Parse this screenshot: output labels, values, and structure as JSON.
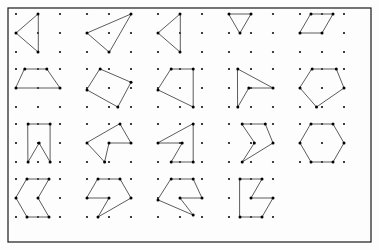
{
  "figure": {
    "canvas": {
      "width": 379,
      "height": 250
    },
    "frame": {
      "x": 8,
      "y": 8,
      "width": 363,
      "height": 234,
      "stroke": "#1a1a1a"
    },
    "style": {
      "dot_color": "#111111",
      "vertex_color": "#000000",
      "edge_color": "#4a4a4a",
      "background": "#fdfdfd",
      "dot_radius": 1.1,
      "vertex_radius": 1.5,
      "edge_width": 0.9
    },
    "grid": {
      "rows": 4,
      "cols": 5,
      "cell_width": 71,
      "cell_height": 55,
      "origin_x": 16,
      "origin_y": 14
    },
    "lattice": {
      "cols": 3,
      "rows": 3,
      "spacing_x": 22,
      "spacing_y": 19,
      "description": "each cell holds a 3x3 square lattice of dots"
    },
    "cells": [
      {
        "id": "cell-r1c1",
        "row": 1,
        "col": 1,
        "shape": "triangle",
        "dots": [
          [
            0,
            0
          ],
          [
            1,
            0
          ],
          [
            2,
            0
          ],
          [
            0,
            1
          ],
          [
            1,
            1
          ],
          [
            2,
            1
          ],
          [
            0,
            2
          ],
          [
            1,
            2
          ],
          [
            2,
            2
          ]
        ],
        "polygon": [
          [
            1,
            0
          ],
          [
            0,
            1
          ],
          [
            1,
            2
          ]
        ]
      },
      {
        "id": "cell-r1c2",
        "row": 1,
        "col": 2,
        "shape": "triangle",
        "dots": [
          [
            0,
            0
          ],
          [
            1,
            0
          ],
          [
            2,
            0
          ],
          [
            0,
            1
          ],
          [
            1,
            1
          ],
          [
            2,
            1
          ],
          [
            0,
            2
          ],
          [
            1,
            2
          ],
          [
            2,
            2
          ]
        ],
        "polygon": [
          [
            2,
            0
          ],
          [
            0,
            1
          ],
          [
            1,
            2
          ]
        ]
      },
      {
        "id": "cell-r1c3",
        "row": 1,
        "col": 3,
        "shape": "triangle",
        "dots": [
          [
            0,
            0
          ],
          [
            1,
            0
          ],
          [
            2,
            0
          ],
          [
            0,
            1
          ],
          [
            1,
            1
          ],
          [
            2,
            1
          ],
          [
            0,
            2
          ],
          [
            1,
            2
          ],
          [
            2,
            2
          ]
        ],
        "polygon": [
          [
            1,
            0
          ],
          [
            0,
            1
          ],
          [
            1,
            2
          ]
        ]
      },
      {
        "id": "cell-r1c4",
        "row": 1,
        "col": 4,
        "shape": "triangle",
        "dots": [
          [
            0,
            0
          ],
          [
            1,
            0
          ],
          [
            2,
            0
          ],
          [
            0,
            1
          ],
          [
            1,
            1
          ],
          [
            2,
            1
          ],
          [
            0,
            2
          ],
          [
            1,
            2
          ],
          [
            2,
            2
          ]
        ],
        "polygon": [
          [
            0,
            0
          ],
          [
            1,
            0
          ],
          [
            0.5,
            1
          ]
        ]
      },
      {
        "id": "cell-r1c5",
        "row": 1,
        "col": 5,
        "shape": "parallelogram",
        "dots": [
          [
            0,
            0
          ],
          [
            1,
            0
          ],
          [
            2,
            0
          ],
          [
            0,
            1
          ],
          [
            1,
            1
          ],
          [
            2,
            1
          ],
          [
            0,
            2
          ],
          [
            1,
            2
          ],
          [
            2,
            2
          ]
        ],
        "polygon": [
          [
            0.5,
            0
          ],
          [
            1.5,
            0
          ],
          [
            1,
            1
          ],
          [
            0,
            1
          ]
        ]
      },
      {
        "id": "cell-r2c1",
        "row": 2,
        "col": 1,
        "shape": "trapezoid",
        "dots": [
          [
            0,
            0
          ],
          [
            1,
            0
          ],
          [
            2,
            0
          ],
          [
            0,
            1
          ],
          [
            1,
            1
          ],
          [
            2,
            1
          ],
          [
            0,
            2
          ],
          [
            1,
            2
          ],
          [
            2,
            2
          ]
        ],
        "polygon": [
          [
            0.4,
            0
          ],
          [
            1.4,
            0
          ],
          [
            2,
            1
          ],
          [
            0,
            1
          ]
        ]
      },
      {
        "id": "cell-r2c2",
        "row": 2,
        "col": 2,
        "shape": "rotated-rectangle",
        "dots": [
          [
            0,
            0
          ],
          [
            1,
            0
          ],
          [
            2,
            0
          ],
          [
            0,
            1
          ],
          [
            1,
            1
          ],
          [
            2,
            1
          ],
          [
            0,
            2
          ],
          [
            1,
            2
          ],
          [
            2,
            2
          ]
        ],
        "polygon": [
          [
            0.6,
            0
          ],
          [
            2,
            0.7
          ],
          [
            1.4,
            2
          ],
          [
            0,
            1.1
          ]
        ]
      },
      {
        "id": "cell-r2c3",
        "row": 2,
        "col": 3,
        "shape": "quadrilateral",
        "dots": [
          [
            0,
            0
          ],
          [
            1,
            0
          ],
          [
            2,
            0
          ],
          [
            0,
            1
          ],
          [
            1,
            1
          ],
          [
            2,
            1
          ],
          [
            0,
            2
          ],
          [
            1,
            2
          ],
          [
            2,
            2
          ]
        ],
        "polygon": [
          [
            0.6,
            0
          ],
          [
            1.6,
            0
          ],
          [
            1.6,
            2
          ],
          [
            0,
            1.1
          ]
        ]
      },
      {
        "id": "cell-r2c4",
        "row": 2,
        "col": 4,
        "shape": "concave-arrow",
        "dots": [
          [
            0,
            0
          ],
          [
            1,
            0
          ],
          [
            2,
            0
          ],
          [
            0,
            1
          ],
          [
            1,
            1
          ],
          [
            2,
            1
          ],
          [
            0,
            2
          ],
          [
            1,
            2
          ],
          [
            2,
            2
          ]
        ],
        "polygon": [
          [
            0.4,
            0
          ],
          [
            2,
            1
          ],
          [
            0.9,
            1
          ],
          [
            0.4,
            2
          ]
        ]
      },
      {
        "id": "cell-r2c5",
        "row": 2,
        "col": 5,
        "shape": "pentagon",
        "dots": [
          [
            0,
            0
          ],
          [
            1,
            0
          ],
          [
            2,
            0
          ],
          [
            0,
            1
          ],
          [
            1,
            1
          ],
          [
            2,
            1
          ],
          [
            0,
            2
          ],
          [
            1,
            2
          ],
          [
            2,
            2
          ]
        ],
        "polygon": [
          [
            0.55,
            0
          ],
          [
            1.65,
            0
          ],
          [
            2,
            1
          ],
          [
            0.75,
            2
          ],
          [
            0,
            1
          ]
        ]
      },
      {
        "id": "cell-r3c1",
        "row": 3,
        "col": 1,
        "shape": "concave-banner",
        "dots": [
          [
            0,
            0
          ],
          [
            1,
            0
          ],
          [
            2,
            0
          ],
          [
            0,
            1
          ],
          [
            1,
            1
          ],
          [
            2,
            1
          ],
          [
            0,
            2
          ],
          [
            1,
            2
          ],
          [
            2,
            2
          ]
        ],
        "polygon": [
          [
            0.55,
            0
          ],
          [
            1.55,
            0
          ],
          [
            1.55,
            2
          ],
          [
            1.05,
            1
          ],
          [
            0.55,
            2
          ]
        ]
      },
      {
        "id": "cell-r3c2",
        "row": 3,
        "col": 2,
        "shape": "concave-pentagon",
        "dots": [
          [
            0,
            0
          ],
          [
            1,
            0
          ],
          [
            2,
            0
          ],
          [
            0,
            1
          ],
          [
            1,
            1
          ],
          [
            2,
            1
          ],
          [
            0,
            2
          ],
          [
            1,
            2
          ],
          [
            2,
            2
          ]
        ],
        "polygon": [
          [
            1.5,
            0
          ],
          [
            2,
            1
          ],
          [
            1,
            1
          ],
          [
            0.8,
            2
          ],
          [
            0,
            1
          ]
        ]
      },
      {
        "id": "cell-r3c3",
        "row": 3,
        "col": 3,
        "shape": "zigzag-pentagon",
        "dots": [
          [
            0,
            0
          ],
          [
            1,
            0
          ],
          [
            2,
            0
          ],
          [
            0,
            1
          ],
          [
            1,
            1
          ],
          [
            2,
            1
          ],
          [
            0,
            2
          ],
          [
            1,
            2
          ],
          [
            2,
            2
          ]
        ],
        "polygon": [
          [
            1.6,
            0
          ],
          [
            1.6,
            2
          ],
          [
            0.6,
            2
          ],
          [
            1.1,
            1
          ],
          [
            0,
            1
          ]
        ]
      },
      {
        "id": "cell-r3c4",
        "row": 3,
        "col": 4,
        "shape": "concave-arrowhead",
        "dots": [
          [
            0,
            0
          ],
          [
            1,
            0
          ],
          [
            2,
            0
          ],
          [
            0,
            1
          ],
          [
            1,
            1
          ],
          [
            2,
            1
          ],
          [
            0,
            2
          ],
          [
            1,
            2
          ],
          [
            2,
            2
          ]
        ],
        "polygon": [
          [
            0.6,
            0
          ],
          [
            1.65,
            0
          ],
          [
            2,
            1
          ],
          [
            0.6,
            2
          ],
          [
            1.15,
            1
          ]
        ]
      },
      {
        "id": "cell-r3c5",
        "row": 3,
        "col": 5,
        "shape": "hexagon",
        "dots": [
          [
            0,
            0
          ],
          [
            1,
            0
          ],
          [
            2,
            0
          ],
          [
            0,
            1
          ],
          [
            1,
            1
          ],
          [
            2,
            1
          ],
          [
            0,
            2
          ],
          [
            1,
            2
          ],
          [
            2,
            2
          ]
        ],
        "polygon": [
          [
            0.5,
            0
          ],
          [
            1.5,
            0
          ],
          [
            2,
            1
          ],
          [
            1.5,
            2
          ],
          [
            0.5,
            2
          ],
          [
            0,
            1
          ]
        ]
      },
      {
        "id": "cell-r4c1",
        "row": 4,
        "col": 1,
        "shape": "chevron-hexagon",
        "dots": [
          [
            0,
            0
          ],
          [
            1,
            0
          ],
          [
            2,
            0
          ],
          [
            0,
            1
          ],
          [
            1,
            1
          ],
          [
            2,
            1
          ],
          [
            0,
            2
          ],
          [
            1,
            2
          ],
          [
            2,
            2
          ]
        ],
        "polygon": [
          [
            0.5,
            0
          ],
          [
            1.5,
            0
          ],
          [
            1,
            1
          ],
          [
            1.5,
            2
          ],
          [
            0.5,
            2
          ],
          [
            0,
            1
          ]
        ]
      },
      {
        "id": "cell-r4c2",
        "row": 4,
        "col": 2,
        "shape": "concave-hexagon",
        "dots": [
          [
            0,
            0
          ],
          [
            1,
            0
          ],
          [
            2,
            0
          ],
          [
            0,
            1
          ],
          [
            1,
            1
          ],
          [
            2,
            1
          ],
          [
            0,
            2
          ],
          [
            1,
            2
          ],
          [
            2,
            2
          ]
        ],
        "polygon": [
          [
            0.5,
            0
          ],
          [
            1.5,
            0
          ],
          [
            2,
            1
          ],
          [
            0.5,
            2
          ],
          [
            1,
            1
          ],
          [
            0,
            1
          ]
        ]
      },
      {
        "id": "cell-r4c3",
        "row": 4,
        "col": 3,
        "shape": "concave-hexagon",
        "dots": [
          [
            0,
            0
          ],
          [
            1,
            0
          ],
          [
            2,
            0
          ],
          [
            0,
            1
          ],
          [
            1,
            1
          ],
          [
            2,
            1
          ],
          [
            0,
            2
          ],
          [
            1,
            2
          ],
          [
            2,
            2
          ]
        ],
        "polygon": [
          [
            0.6,
            0
          ],
          [
            1.6,
            0
          ],
          [
            2,
            1
          ],
          [
            1,
            1
          ],
          [
            1.6,
            1.9
          ],
          [
            0,
            1.1
          ]
        ]
      },
      {
        "id": "cell-r4c4",
        "row": 4,
        "col": 4,
        "shape": "concave-hexagon",
        "dots": [
          [
            0,
            0
          ],
          [
            1,
            0
          ],
          [
            2,
            0
          ],
          [
            0,
            1
          ],
          [
            1,
            1
          ],
          [
            2,
            1
          ],
          [
            0,
            2
          ],
          [
            1,
            2
          ],
          [
            2,
            2
          ]
        ],
        "polygon": [
          [
            0.5,
            0
          ],
          [
            1.5,
            0
          ],
          [
            1,
            1
          ],
          [
            2,
            1
          ],
          [
            1.5,
            2
          ],
          [
            0.5,
            2
          ]
        ]
      }
    ]
  }
}
